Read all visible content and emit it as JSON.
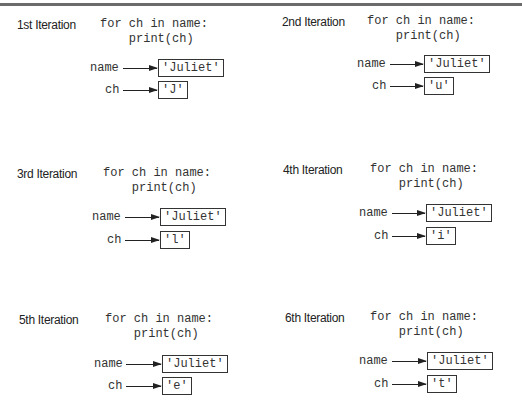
{
  "diagram": {
    "code_line1": "for ch in name:",
    "code_line2": "    print(ch)",
    "var_name": "name",
    "var_ch": "ch",
    "name_value": "'Juliet'",
    "panels": [
      {
        "label": "1st Iteration",
        "ch_value": "'J'"
      },
      {
        "label": "2nd Iteration",
        "ch_value": "'u'"
      },
      {
        "label": "3rd Iteration",
        "ch_value": "'l'"
      },
      {
        "label": "4th Iteration",
        "ch_value": "'i'"
      },
      {
        "label": "5th Iteration",
        "ch_value": "'e'"
      },
      {
        "label": "6th Iteration",
        "ch_value": "'t'"
      }
    ]
  }
}
